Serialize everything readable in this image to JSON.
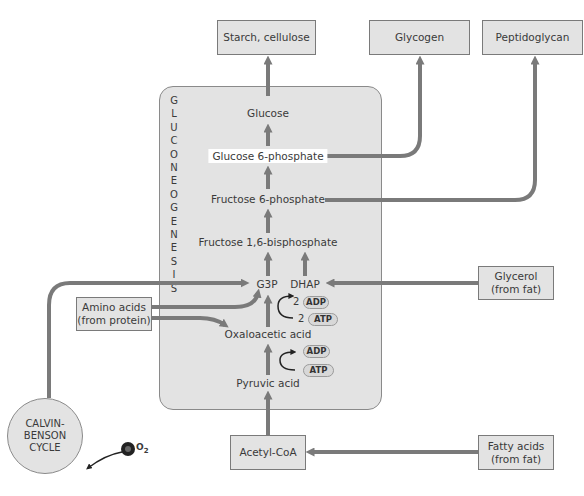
{
  "diagram": {
    "panel_label_letters": [
      "G",
      "L",
      "U",
      "C",
      "O",
      "N",
      "E",
      "O",
      "G",
      "E",
      "N",
      "E",
      "S",
      "I",
      "S"
    ],
    "products": {
      "starch": "Starch, cellulose",
      "glycogen": "Glycogen",
      "peptidoglycan": "Peptidoglycan"
    },
    "intermediates": {
      "glucose": "Glucose",
      "glucose6p": "Glucose 6-phosphate",
      "fructose6p": "Fructose 6-phosphate",
      "fructose16bp": "Fructose 1,6-bisphosphate",
      "g3p": "G3P",
      "dhap": "DHAP",
      "oxaloacetic": "Oxaloacetic acid",
      "pyruvic": "Pyruvic acid"
    },
    "energy": {
      "upper_adp": "ADP",
      "upper_atp": "ATP",
      "upper_coeff_adp": "2",
      "upper_coeff_atp": "2",
      "lower_adp": "ADP",
      "lower_atp": "ATP"
    },
    "sources": {
      "amino_line1": "Amino acids",
      "amino_line2": "(from protein)",
      "glycerol_line1": "Glycerol",
      "glycerol_line2": "(from fat)",
      "acetyl": "Acetyl-CoA",
      "fatty_line1": "Fatty acids",
      "fatty_line2": "(from fat)",
      "calvin_line1": "CALVIN-",
      "calvin_line2": "BENSON",
      "calvin_line3": "CYCLE",
      "co2_c": "C",
      "co2_o": "O",
      "co2_sub": "2"
    },
    "colors": {
      "arrow": "#7a7a7a",
      "box_fill": "#e3e3e3",
      "border": "#7a7a7a",
      "text": "#3a3a3a"
    }
  }
}
